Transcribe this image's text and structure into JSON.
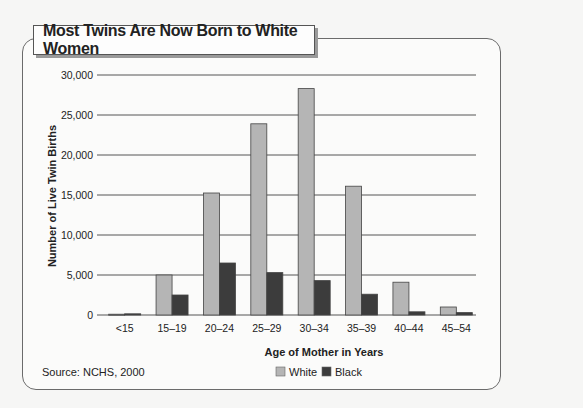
{
  "chart_data": {
    "type": "bar",
    "title": "Most Twins Are Now Born to White Women",
    "xlabel": "Age of Mother in Years",
    "ylabel": "Number of Live Twin Births",
    "ylim": [
      0,
      30000
    ],
    "yticks": [
      0,
      5000,
      10000,
      15000,
      20000,
      25000,
      30000
    ],
    "ytick_labels": [
      "0",
      "5,000",
      "10,000",
      "15,000",
      "20,000",
      "25,000",
      "30,000"
    ],
    "grid": true,
    "legend_position": "bottom-center",
    "categories": [
      "<15",
      "15–19",
      "20–24",
      "25–29",
      "30–34",
      "35–39",
      "40–44",
      "45–54"
    ],
    "series": [
      {
        "name": "White",
        "color": "#b5b5b5",
        "values": [
          100,
          5000,
          15250,
          23900,
          28300,
          16100,
          4100,
          1000
        ]
      },
      {
        "name": "Black",
        "color": "#3c3c3c",
        "values": [
          150,
          2500,
          6500,
          5300,
          4300,
          2600,
          400,
          300
        ]
      }
    ],
    "source": "Source: NCHS, 2000"
  }
}
